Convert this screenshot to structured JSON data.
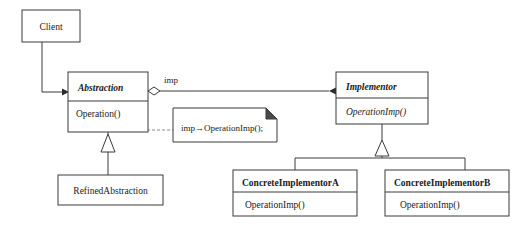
{
  "diagram": {
    "type": "uml-class-diagram",
    "background_color": "#ffffff",
    "line_color": "#3a3a3a",
    "text_color": "#1a1a1a"
  },
  "classes": {
    "client": {
      "name": "Client",
      "style": "plain",
      "compartments": []
    },
    "abstraction": {
      "name": "Abstraction",
      "style": "italic-bold",
      "operations": [
        {
          "label": "Operation()",
          "style": "plain"
        }
      ]
    },
    "refined_abstraction": {
      "name": "RefinedAbstraction",
      "style": "plain",
      "operations": []
    },
    "implementor": {
      "name": "Implementor",
      "style": "italic-bold",
      "operations": [
        {
          "label": "OperationImp()",
          "style": "italic"
        }
      ]
    },
    "concrete_implementor_a": {
      "name": "ConcreteImplementorA",
      "style": "bold",
      "operations": [
        {
          "label": "OperationImp()",
          "style": "plain"
        }
      ]
    },
    "concrete_implementor_b": {
      "name": "ConcreteImplementorB",
      "style": "bold",
      "operations": [
        {
          "label": "OperationImp()",
          "style": "plain"
        }
      ]
    }
  },
  "note": {
    "text": "imp→OperationImp();",
    "fold_color": "#4a4a4a"
  },
  "relationships": {
    "client_to_abstraction": {
      "kind": "association",
      "arrowhead": "solid",
      "label": ""
    },
    "abstraction_to_implementor": {
      "kind": "aggregation",
      "source_decoration": "hollow-diamond",
      "target_decoration": "solid-arrow",
      "label": "imp"
    },
    "refined_to_abstraction": {
      "kind": "generalization",
      "arrowhead": "hollow-triangle",
      "label": ""
    },
    "concrete_a_to_implementor": {
      "kind": "generalization",
      "arrowhead": "hollow-triangle",
      "label": ""
    },
    "concrete_b_to_implementor": {
      "kind": "generalization",
      "arrowhead": "hollow-triangle",
      "label": ""
    },
    "operation_to_note": {
      "kind": "note-anchor",
      "style": "dashed",
      "anchor_decoration": "hollow-circle",
      "label": ""
    }
  }
}
